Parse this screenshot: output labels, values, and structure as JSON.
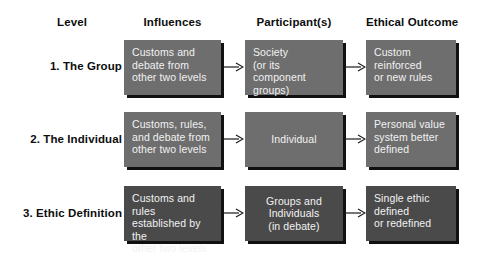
{
  "figure": {
    "colors": {
      "box_light": "#6e6e6e",
      "box_dark": "#4a4a4a",
      "box_text": "#f2f2f2",
      "label_text": "#0d0d0d",
      "shadow": "#111111",
      "background": "#ffffff"
    }
  },
  "headers": {
    "level": "Level",
    "influences": "Influences",
    "participants": "Participant(s)",
    "outcome": "Ethical Outcome"
  },
  "rows": [
    {
      "level_label": "1. The Group",
      "influences": "Customs and debate from other two levels",
      "participants": "Society (or its component groups)",
      "outcome": "Custom reinforced or new rules",
      "shade": "light"
    },
    {
      "level_label": "2. The Individual",
      "influences": "Customs, rules, and debate from other two levels",
      "participants": "Individual",
      "outcome": "Personal value system better defined",
      "shade": "light"
    },
    {
      "level_label": "3. Ethic Definition",
      "influences": "Customs and rules established by the other two levels",
      "participants": "Groups and Individuals (in debate)",
      "outcome": "Single ethic defined or redefined",
      "shade": "dark"
    }
  ],
  "row_lines": [
    {
      "influences": [
        "Customs and",
        "debate from",
        "other two levels"
      ],
      "participants": [
        "Society",
        "(or its component",
        "groups)"
      ],
      "outcome": [
        "Custom reinforced",
        "or new rules"
      ]
    },
    {
      "influences": [
        "Customs, rules,",
        "and debate from",
        "other two levels"
      ],
      "participants": [
        "Individual"
      ],
      "outcome": [
        "Personal value",
        "system better",
        "defined"
      ]
    },
    {
      "influences": [
        "Customs and rules",
        "established by the",
        "other two levels"
      ],
      "participants": [
        "Groups and",
        "Individuals",
        "(in debate)"
      ],
      "outcome": [
        "Single ethic",
        "defined",
        "or redefined"
      ]
    }
  ],
  "arrows": {
    "count": 6,
    "direction": "right",
    "icon": "arrow-right-icon"
  }
}
